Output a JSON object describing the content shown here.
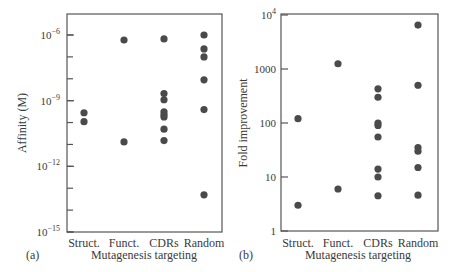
{
  "chart_data": [
    {
      "id": "a",
      "type": "scatter",
      "panel_label": "(a)",
      "title": "",
      "xlabel": "Mutagenesis targeting",
      "ylabel": "Affinity (M)",
      "yscale": "log",
      "ylim": [
        1e-15,
        1e-06
      ],
      "categories": [
        "Struct.",
        "Funct.",
        "CDRs",
        "Random"
      ],
      "y_ticks": [
        {
          "value": 1e-06,
          "base": "10",
          "exp": "−6"
        },
        {
          "value": 1e-09,
          "base": "10",
          "exp": "−9"
        },
        {
          "value": 1e-12,
          "base": "10",
          "exp": "−12"
        },
        {
          "value": 1e-15,
          "base": "10",
          "exp": "−15"
        }
      ],
      "minor_ticks_every_decade": true,
      "grid": false,
      "legend": null,
      "series": [
        {
          "category": "Struct.",
          "values": [
            2.8e-10,
            1.1e-10
          ]
        },
        {
          "category": "Funct.",
          "values": [
            5.9e-07,
            1.3e-11
          ]
        },
        {
          "category": "CDRs",
          "values": [
            6.6e-07,
            2.1e-09,
            1.1e-09,
            3.1e-10,
            2.3e-10,
            1.8e-10,
            5e-11,
            1.5e-11
          ]
        },
        {
          "category": "Random",
          "values": [
            1e-06,
            2.3e-07,
            1e-07,
            9e-09,
            3.9e-10,
            5e-14
          ]
        }
      ]
    },
    {
      "id": "b",
      "type": "scatter",
      "panel_label": "(b)",
      "title": "",
      "xlabel": "Mutagenesis targeting",
      "ylabel": "Fold improvement",
      "yscale": "log",
      "ylim": [
        1,
        10000
      ],
      "categories": [
        "Struct.",
        "Funct.",
        "CDRs",
        "Random"
      ],
      "y_ticks": [
        {
          "value": 10000,
          "base": "10",
          "exp": "4"
        },
        {
          "value": 1000,
          "base": "1000",
          "exp": ""
        },
        {
          "value": 100,
          "base": "100",
          "exp": ""
        },
        {
          "value": 10,
          "base": "10",
          "exp": ""
        },
        {
          "value": 1,
          "base": "1",
          "exp": ""
        }
      ],
      "minor_ticks_every_decade": false,
      "grid": false,
      "legend": null,
      "series": [
        {
          "category": "Struct.",
          "values": [
            120,
            3
          ]
        },
        {
          "category": "Funct.",
          "values": [
            1250,
            6
          ]
        },
        {
          "category": "CDRs",
          "values": [
            430,
            300,
            100,
            90,
            55,
            14,
            10,
            4.5
          ]
        },
        {
          "category": "Random",
          "values": [
            6500,
            500,
            35,
            30,
            15,
            4.6
          ]
        }
      ]
    }
  ],
  "colors": {
    "marker": "#4a4a4a",
    "axis": "#555555",
    "text": "#3a3a3a"
  }
}
